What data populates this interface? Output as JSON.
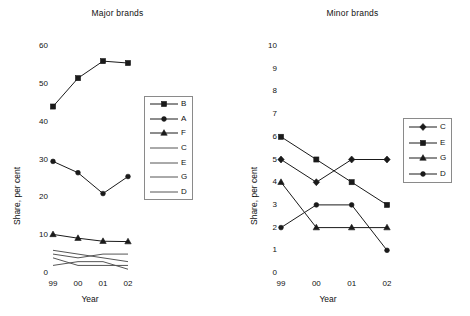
{
  "chart_data": [
    {
      "type": "line",
      "title": "Major brands",
      "xlabel": "Year",
      "ylabel": "Share, per cent",
      "categories": [
        "99",
        "00",
        "01",
        "02"
      ],
      "ylim": [
        0,
        60
      ],
      "yticks": [
        0,
        10,
        20,
        30,
        40,
        50,
        60
      ],
      "grid": false,
      "legend_position": "right-middle",
      "series": [
        {
          "name": "B",
          "marker": "square",
          "values": [
            44.0,
            51.5,
            56.0,
            55.5
          ]
        },
        {
          "name": "A",
          "marker": "circle",
          "values": [
            29.5,
            26.5,
            21.0,
            25.5
          ]
        },
        {
          "name": "F",
          "marker": "triangle",
          "values": [
            10.2,
            9.2,
            8.4,
            8.3
          ]
        },
        {
          "name": "C",
          "marker": "none",
          "values": [
            5.0,
            4.0,
            5.0,
            5.0
          ]
        },
        {
          "name": "E",
          "marker": "none",
          "values": [
            6.0,
            5.0,
            4.0,
            3.0
          ]
        },
        {
          "name": "G",
          "marker": "none",
          "values": [
            4.0,
            2.0,
            2.0,
            2.0
          ]
        },
        {
          "name": "D",
          "marker": "none",
          "values": [
            2.0,
            3.0,
            3.0,
            1.0
          ]
        }
      ]
    },
    {
      "type": "line",
      "title": "Minor brands",
      "xlabel": "Year",
      "ylabel": "Share, per cent",
      "categories": [
        "99",
        "00",
        "01",
        "02"
      ],
      "ylim": [
        0,
        10
      ],
      "yticks": [
        0,
        1,
        2,
        3,
        4,
        5,
        6,
        7,
        8,
        9,
        10
      ],
      "grid": false,
      "legend_position": "right-middle",
      "series": [
        {
          "name": "C",
          "marker": "diamond",
          "values": [
            5,
            4,
            5,
            5
          ]
        },
        {
          "name": "E",
          "marker": "square",
          "values": [
            6,
            5,
            4,
            3
          ]
        },
        {
          "name": "G",
          "marker": "triangle",
          "values": [
            4,
            2,
            2,
            2
          ]
        },
        {
          "name": "D",
          "marker": "circle",
          "values": [
            2,
            3,
            3,
            1
          ]
        }
      ]
    }
  ],
  "colors": {
    "series": "#1a1a1a",
    "plain_line": "#555555",
    "legend_border": "#8a8a8a",
    "text": "#111111",
    "background": "#ffffff"
  }
}
